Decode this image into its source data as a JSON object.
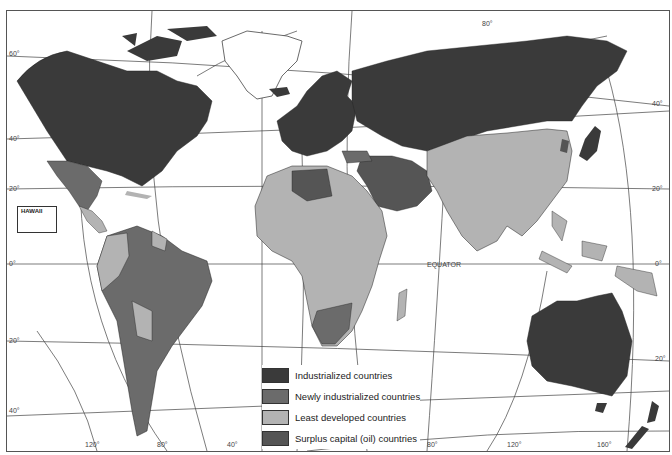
{
  "map": {
    "type": "world thematic map",
    "colors": {
      "industrialized": "#3a3a3a",
      "newly_industrialized": "#6b6b6b",
      "least_developed": "#b3b3b3",
      "surplus_oil": "#555555",
      "unclassified": "#ffffff",
      "graticule": "#444444"
    },
    "labels": {
      "equator": "EQUATOR",
      "hawaii": "HAWAII"
    },
    "latitude_labels": [
      "60°",
      "40°",
      "20°",
      "0°",
      "20°",
      "40°"
    ],
    "right_latitude_labels": [
      "80°",
      "40°",
      "20°",
      "0°",
      "20°"
    ],
    "longitude_labels": [
      "120°",
      "80°",
      "40°",
      "80°",
      "120°",
      "160°"
    ]
  },
  "legend": {
    "items": [
      {
        "label": "Industrialized countries",
        "color": "#3a3a3a"
      },
      {
        "label": "Newly industrialized countries",
        "color": "#6b6b6b"
      },
      {
        "label": "Least developed countries",
        "color": "#b3b3b3"
      },
      {
        "label": "Surplus capital (oil) countries",
        "color": "#555555"
      }
    ]
  }
}
